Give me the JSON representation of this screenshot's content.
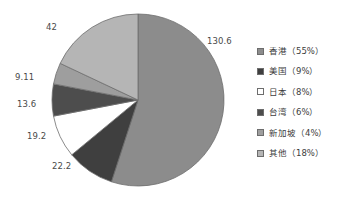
{
  "chart_data": {
    "type": "pie",
    "title": "",
    "subtitle": "",
    "xlabel": "",
    "ylabel": "",
    "grid": false,
    "legend_position": "right",
    "start_angle": 0,
    "direction": "clockwise",
    "categories": [
      "香港",
      "美国",
      "日本",
      "台湾",
      "新加坡",
      "其他"
    ],
    "values": [
      130.6,
      22.2,
      19.2,
      13.6,
      9.11,
      42
    ],
    "percents": [
      55,
      9,
      8,
      6,
      4,
      18
    ],
    "colors": [
      "#8c8c8c",
      "#3f3f3f",
      "#ffffff",
      "#4d4d4d",
      "#9e9e9e",
      "#b5b5b5"
    ],
    "data_labels": [
      "130.6",
      "22.2",
      "19.2",
      "13.6",
      "9.11",
      "42"
    ],
    "legend_entries": [
      "香港（55%）",
      "美国（9%）",
      "日本（8%）",
      "台湾（6%）",
      "新加坡（4%）",
      "其他（18%）"
    ]
  },
  "figure": {
    "background_color": "#ffffff",
    "slice_outline_color": "#6d6d6d",
    "label_text_color": "#4a4a4a"
  }
}
